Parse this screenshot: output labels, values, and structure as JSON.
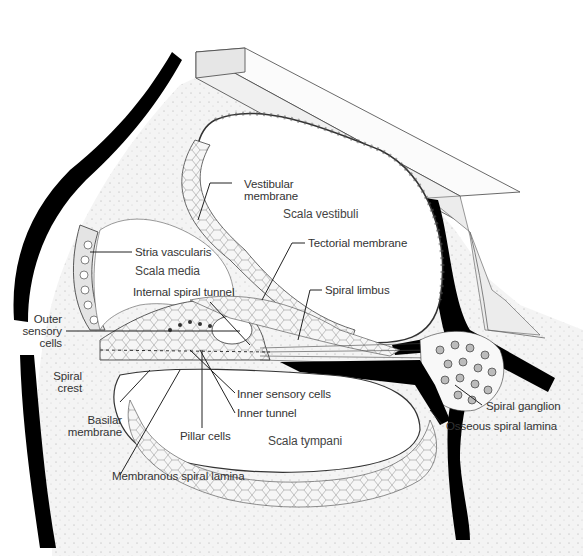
{
  "figure": {
    "colors": {
      "bone": "#f2f2f2",
      "black_wall": "#000000",
      "line": "#333333",
      "text": "#333333"
    }
  },
  "labels": {
    "vestibular_membrane": [
      "Vestibular",
      "membrane"
    ],
    "scala_vestibuli": "Scala vestibuli",
    "stria_vascularis": "Stria vascularis",
    "tectorial_membrane": "Tectorial membrane",
    "scala_media": "Scala media",
    "spiral_limbus": "Spiral limbus",
    "internal_spiral_tunnel": "Internal spiral tunnel",
    "outer_sensory_cells": [
      "Outer",
      "sensory",
      "cells"
    ],
    "spiral_crest": [
      "Spiral",
      "crest"
    ],
    "inner_sensory_cells": "Inner sensory cells",
    "inner_tunnel": "Inner tunnel",
    "spiral_ganglion": "Spiral ganglion",
    "basilar_membrane": [
      "Basilar",
      "membrane"
    ],
    "osseous_spiral_lamina": "Osseous spiral lamina",
    "pillar_cells": "Pillar cells",
    "scala_tympani": "Scala tympani",
    "membranous_spiral_lamina": "Membranous spiral lamina"
  }
}
